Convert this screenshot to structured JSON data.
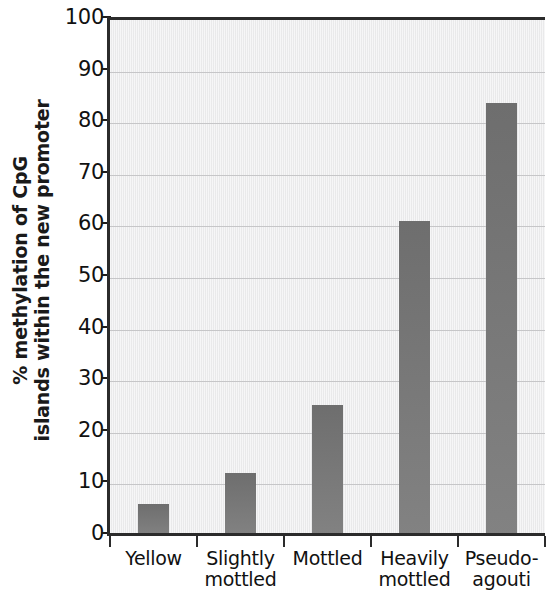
{
  "chart_data": {
    "type": "bar",
    "title": "",
    "subtitle": "",
    "xlabel": "",
    "ylabel": "% methylation of CpG islands within the new promoter",
    "ylabel_line1": "% methylation of CpG",
    "ylabel_line2": "islands within the new promoter",
    "categories": [
      "Yellow",
      "Slightly mottled",
      "Mottled",
      "Heavily mottled",
      "Pseudo-agouti"
    ],
    "category_lines": [
      [
        "Yellow",
        ""
      ],
      [
        "Slightly",
        "mottled"
      ],
      [
        "Mottled",
        ""
      ],
      [
        "Heavily",
        "mottled"
      ],
      [
        "Pseudo-",
        "agouti"
      ]
    ],
    "values": [
      6.2,
      12.2,
      25.4,
      61.0,
      84.0
    ],
    "ylim": [
      0,
      100
    ],
    "ytick_values": [
      0,
      10,
      20,
      30,
      40,
      50,
      60,
      70,
      80,
      90,
      100
    ],
    "ytick_labels": [
      "0",
      "10",
      "20",
      "30",
      "40",
      "50",
      "60",
      "70",
      "80",
      "90",
      "100"
    ],
    "grid": "horizontal",
    "legend": "none",
    "bar_color": "#767676",
    "plot_background": "#ececed",
    "axis_color": "#2b2b2b",
    "gridline_color": "#c6c6c8"
  }
}
